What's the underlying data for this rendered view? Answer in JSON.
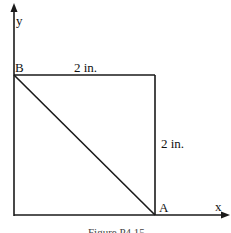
{
  "diagram": {
    "axes": {
      "x_label": "x",
      "y_label": "y"
    },
    "points": {
      "A": "A",
      "B": "B"
    },
    "dimensions": {
      "top": "2 in.",
      "right": "2 in."
    },
    "caption": "Figure P4.15",
    "colors": {
      "line": "#1a1a1a",
      "background": "#ffffff"
    }
  }
}
